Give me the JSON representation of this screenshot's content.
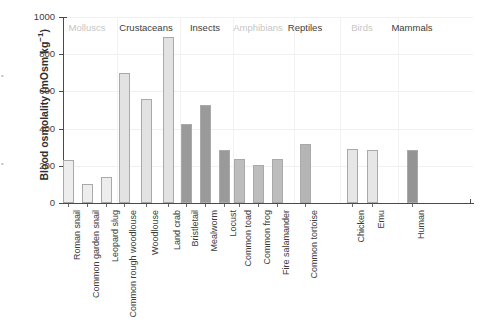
{
  "chart_data": {
    "type": "bar",
    "title": "",
    "xlabel": "",
    "ylabel": "Blood osmolality (mOsm kg−1)",
    "ylim": [
      0,
      1000
    ],
    "yticks": [
      0,
      200,
      400,
      600,
      800,
      1000
    ],
    "grid": true,
    "legend": "none",
    "categories": [
      "Roman snail",
      "Common garden snail",
      "Leopard slug",
      "Common rough woodlouse",
      "Woodlouse",
      "Land crab",
      "Bristletail",
      "Mealworm",
      "Locust",
      "Common toad",
      "Common frog",
      "Fire salamander",
      "Common tortoise",
      "Chicken",
      "Emu",
      "Human"
    ],
    "values": [
      230,
      100,
      140,
      700,
      560,
      895,
      425,
      525,
      285,
      235,
      205,
      235,
      315,
      290,
      285,
      285
    ],
    "groups": [
      {
        "label": "Molluscs",
        "emphasis": "dim",
        "members": [
          "Roman snail",
          "Common garden snail",
          "Leopard slug"
        ]
      },
      {
        "label": "Crustaceans",
        "emphasis": "strong",
        "members": [
          "Common rough woodlouse",
          "Woodlouse",
          "Land crab"
        ]
      },
      {
        "label": "Insects",
        "emphasis": "strong",
        "members": [
          "Bristletail",
          "Mealworm",
          "Locust"
        ]
      },
      {
        "label": "Amphibians",
        "emphasis": "dim",
        "members": [
          "Common toad",
          "Common frog",
          "Fire salamander"
        ]
      },
      {
        "label": "Reptiles",
        "emphasis": "strong",
        "members": [
          "Common tortoise"
        ]
      },
      {
        "label": "Birds",
        "emphasis": "dim",
        "members": [
          "Chicken",
          "Emu"
        ]
      },
      {
        "label": "Mammals",
        "emphasis": "strong",
        "members": [
          "Human"
        ]
      }
    ],
    "bar_colors": [
      "#ededed",
      "#ededed",
      "#ededed",
      "#e2e2e2",
      "#e2e2e2",
      "#e2e2e2",
      "#9a9a9a",
      "#9a9a9a",
      "#9a9a9a",
      "#bdbdbd",
      "#bdbdbd",
      "#bdbdbd",
      "#b5b5b5",
      "#e6e6e6",
      "#e6e6e6",
      "#949494"
    ]
  },
  "axes": {
    "y_title": "Blood osmolality (mOsm kg",
    "y_title_exponent": "−1",
    "y_title_close": ")"
  },
  "artifacts": {
    "left_top": "•",
    "left_bottom": "•"
  },
  "colors": {
    "axis": "#4a4a4a",
    "grid": "#f0f0f0",
    "text": "#3a3a3a",
    "dim_text": "#c6c6c6",
    "bar_outline": "#a9a9a9"
  }
}
